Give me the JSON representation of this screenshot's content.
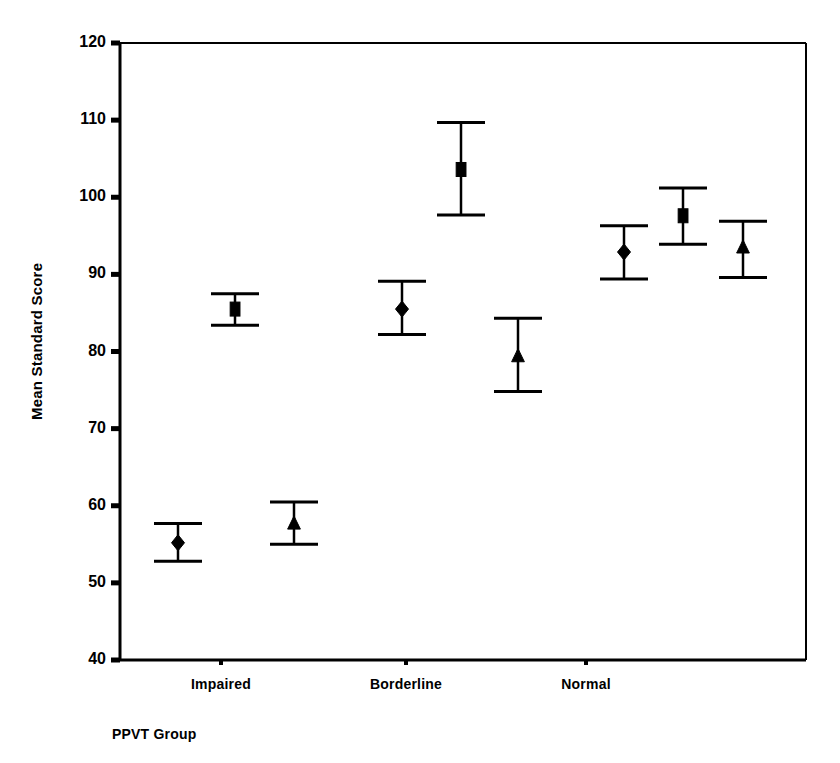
{
  "chart_data": {
    "type": "scatter",
    "title": "",
    "xlabel": "PPVT Group",
    "ylabel": "Mean Standard Score",
    "ylim": [
      40,
      120
    ],
    "yticks": [
      40,
      50,
      60,
      70,
      80,
      90,
      100,
      110,
      120
    ],
    "ytick_labels": [
      "40",
      "50",
      "60",
      "70",
      "80",
      "90",
      "100",
      "110",
      "120"
    ],
    "grid": false,
    "legend": "none",
    "categories": [
      "Impaired",
      "Borderline",
      "Normal"
    ],
    "error_bars": "mean with upper/lower caps",
    "series": [
      {
        "name": "diamond-series",
        "marker": "diamond",
        "values": [
          55.2,
          85.5,
          92.9
        ],
        "upper": [
          57.7,
          89.1,
          96.3
        ],
        "lower": [
          52.8,
          82.2,
          89.4
        ]
      },
      {
        "name": "square-series",
        "marker": "square",
        "values": [
          85.5,
          103.6,
          97.6
        ],
        "upper": [
          87.5,
          109.7,
          101.2
        ],
        "lower": [
          83.4,
          97.7,
          93.9
        ]
      },
      {
        "name": "triangle-series",
        "marker": "triangle",
        "values": [
          57.7,
          79.4,
          93.5
        ],
        "upper": [
          60.5,
          84.3,
          96.9
        ],
        "lower": [
          55.0,
          74.8,
          89.6
        ]
      }
    ],
    "point_x_positions": [
      [
        178,
        402,
        624
      ],
      [
        235,
        461,
        683
      ],
      [
        294,
        518,
        743
      ]
    ],
    "category_tick_x": [
      221,
      406,
      586
    ],
    "colors": {
      "marker": "#000000",
      "error_bar": "#000000",
      "axis": "#000000",
      "background": "#ffffff"
    }
  },
  "axes": {
    "y_title": "Mean Standard Score",
    "x_title": "PPVT Group"
  }
}
